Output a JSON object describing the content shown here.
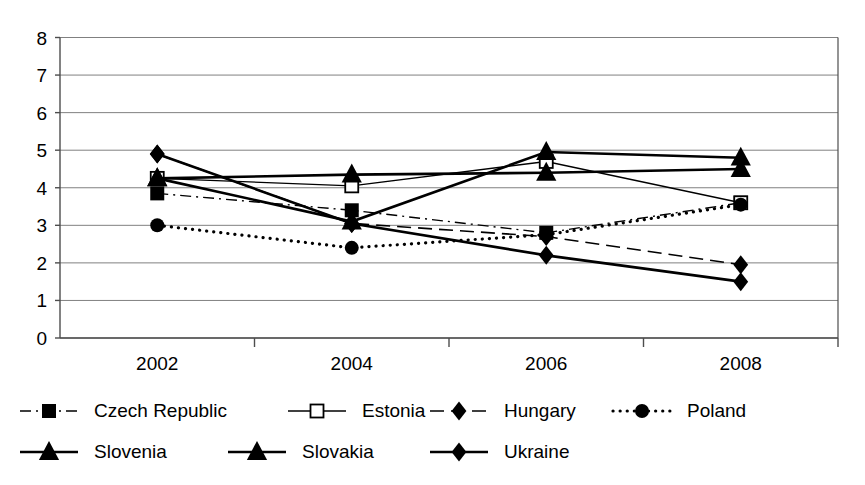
{
  "chart_data": {
    "type": "line",
    "title": "",
    "xlabel": "",
    "ylabel": "",
    "categories": [
      "2002",
      "2004",
      "2006",
      "2008"
    ],
    "ylim": [
      0,
      8
    ],
    "y_ticks": [
      "0",
      "1",
      "2",
      "3",
      "4",
      "5",
      "6",
      "7",
      "8"
    ],
    "grid": true,
    "legend_position": "bottom",
    "series": [
      {
        "name": "Czech Republic",
        "marker": "filled-square",
        "line_style": "dash-dot",
        "line_width": 1.4,
        "color": "#000000",
        "values": [
          3.85,
          3.4,
          2.8,
          3.6
        ]
      },
      {
        "name": "Estonia",
        "marker": "open-square",
        "line_style": "solid",
        "line_width": 1.4,
        "color": "#000000",
        "values": [
          4.25,
          4.05,
          4.7,
          3.6
        ]
      },
      {
        "name": "Hungary",
        "marker": "filled-diamond",
        "line_style": "dashed",
        "line_width": 1.6,
        "color": "#000000",
        "values": [
          4.9,
          3.05,
          2.7,
          1.95
        ]
      },
      {
        "name": "Poland",
        "marker": "filled-circle",
        "line_style": "dotted",
        "line_width": 3.2,
        "color": "#000000",
        "values": [
          3.0,
          2.4,
          2.75,
          3.55
        ]
      },
      {
        "name": "Slovenia",
        "marker": "filled-triangle",
        "line_style": "solid",
        "line_width": 2.6,
        "color": "#000000",
        "values": [
          4.25,
          4.35,
          4.4,
          4.5
        ]
      },
      {
        "name": "Slovakia",
        "marker": "filled-triangle",
        "line_style": "solid",
        "line_width": 2.6,
        "color": "#000000",
        "values": [
          4.25,
          3.1,
          4.95,
          4.8
        ]
      },
      {
        "name": "Ukraine",
        "marker": "filled-diamond",
        "line_style": "solid",
        "line_width": 2.6,
        "color": "#000000",
        "values": [
          4.9,
          3.05,
          2.2,
          1.5
        ]
      }
    ]
  },
  "legend": {
    "rows": [
      [
        "Czech Republic",
        "Estonia",
        "Hungary",
        "Poland"
      ],
      [
        "Slovenia",
        "Slovakia",
        "Ukraine"
      ]
    ]
  }
}
